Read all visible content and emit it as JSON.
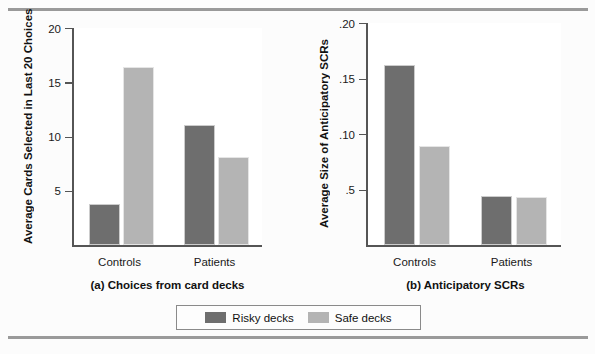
{
  "figure": {
    "background_color": "#fcfcfc",
    "rule_color": "#9a9a9a"
  },
  "colors": {
    "risky": "#6e6e6e",
    "safe": "#b4b4b4",
    "axis": "#555555",
    "text": "#1a1a1a"
  },
  "legend": {
    "position": "bottom-center",
    "entries": [
      {
        "label": "Risky decks",
        "color": "#6e6e6e",
        "swatch_name": "legend-swatch-risky"
      },
      {
        "label": "Safe decks",
        "color": "#b4b4b4",
        "swatch_name": "legend-swatch-safe"
      }
    ]
  },
  "chart_data": [
    {
      "type": "bar",
      "panel": "a",
      "title": "(a) Choices from card decks",
      "xlabel": "",
      "ylabel": "Average Cards Selected in Last 20 Choices",
      "categories": [
        "Controls",
        "Patients"
      ],
      "ylim": [
        0,
        20
      ],
      "yticks": [
        5,
        10,
        15,
        20
      ],
      "ytick_labels": [
        "5",
        "10",
        "15",
        "20"
      ],
      "grid": false,
      "series": [
        {
          "name": "Risky decks",
          "color": "#6e6e6e",
          "values": [
            3.8,
            11.1
          ]
        },
        {
          "name": "Safe decks",
          "color": "#b4b4b4",
          "values": [
            16.4,
            8.1
          ]
        }
      ]
    },
    {
      "type": "bar",
      "panel": "b",
      "title": "(b) Anticipatory SCRs",
      "xlabel": "",
      "ylabel": "Average Size of Anticipatory SCRs",
      "categories": [
        "Controls",
        "Patients"
      ],
      "ylim": [
        0,
        0.2
      ],
      "yticks": [
        0.05,
        0.1,
        0.15,
        0.2
      ],
      "ytick_labels": [
        ".5",
        ".10",
        ".15",
        ".20"
      ],
      "grid": false,
      "series": [
        {
          "name": "Risky decks",
          "color": "#6e6e6e",
          "values": [
            0.162,
            0.044
          ]
        },
        {
          "name": "Safe decks",
          "color": "#b4b4b4",
          "values": [
            0.089,
            0.043
          ]
        }
      ]
    }
  ]
}
